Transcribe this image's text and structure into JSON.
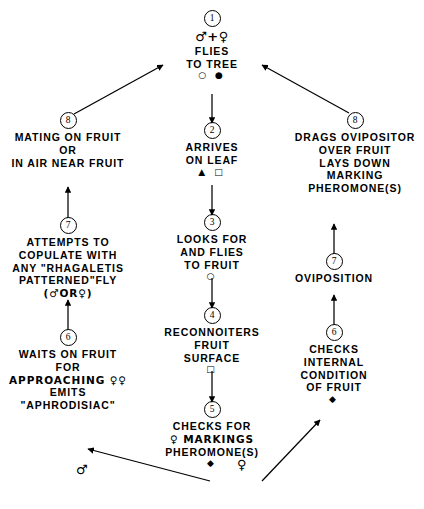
{
  "diagram": {
    "type": "flowchart",
    "stroke_color": "#000000",
    "background_color": "#ffffff"
  },
  "nodes": {
    "n1": {
      "badge": "1",
      "lines": [
        "♂+♀",
        "FLIES",
        "TO TREE"
      ],
      "marks": "○ ●"
    },
    "n2": {
      "badge": "2",
      "lines": [
        "ARRIVES",
        "ON LEAF"
      ],
      "marks": "▲ □"
    },
    "n3": {
      "badge": "3",
      "lines": [
        "LOOKS FOR",
        "AND FLIES",
        "TO FRUIT"
      ],
      "marks": "○"
    },
    "n4": {
      "badge": "4",
      "lines": [
        "RECONNOITERS",
        "FRUIT",
        "SURFACE"
      ],
      "marks": "□"
    },
    "n5": {
      "badge": "5",
      "lines": [
        "CHECKS FOR",
        "♀ MARKINGS",
        "PHEROMONE(S)"
      ],
      "marks": "◆"
    },
    "left6": {
      "badge": "6",
      "lines": [
        "WAITS ON FRUIT",
        "FOR",
        "APPROACHING ♀♀",
        "EMITS",
        "\"APHRODISIAC\""
      ],
      "marks": ""
    },
    "left7": {
      "badge": "7",
      "lines": [
        "ATTEMPTS TO",
        "COPULATE WITH",
        "ANY \"RHAGALETIS",
        "PATTERNED\"FLY",
        "(♂OR♀)"
      ],
      "marks": ""
    },
    "left8": {
      "badge": "8",
      "lines": [
        "MATING ON FRUIT",
        "OR",
        "IN AIR NEAR FRUIT"
      ],
      "marks": ""
    },
    "right6": {
      "badge": "6",
      "lines": [
        "CHECKS",
        "INTERNAL",
        "CONDITION",
        "OF FRUIT"
      ],
      "marks": "◆"
    },
    "right7": {
      "badge": "7",
      "lines": [
        "OVIPOSITION"
      ],
      "marks": ""
    },
    "right8": {
      "badge": "8",
      "lines": [
        "DRAGS OVIPOSITOR",
        "OVER FRUIT",
        "LAYS DOWN",
        "MARKING",
        "PHEROMONE(S)"
      ],
      "marks": ""
    }
  },
  "edge_labels": {
    "male_branch": "♂",
    "female_branch": "♀"
  }
}
